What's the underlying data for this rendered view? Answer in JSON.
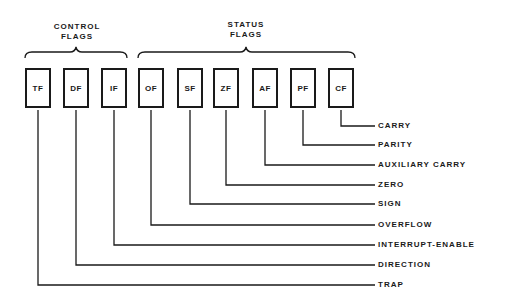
{
  "diagram": {
    "groups": [
      {
        "title_line1": "CONTROL",
        "title_line2": "FLAGS"
      },
      {
        "title_line1": "STATUS",
        "title_line2": "FLAGS"
      }
    ],
    "flags": [
      {
        "abbr": "TF",
        "name": "TRAP"
      },
      {
        "abbr": "DF",
        "name": "DIRECTION"
      },
      {
        "abbr": "IF",
        "name": "INTERRUPT-ENABLE"
      },
      {
        "abbr": "OF",
        "name": "OVERFLOW"
      },
      {
        "abbr": "SF",
        "name": "SIGN"
      },
      {
        "abbr": "ZF",
        "name": "ZERO"
      },
      {
        "abbr": "AF",
        "name": "AUXILIARY CARRY"
      },
      {
        "abbr": "PF",
        "name": "PARITY"
      },
      {
        "abbr": "CF",
        "name": "CARRY"
      }
    ]
  }
}
